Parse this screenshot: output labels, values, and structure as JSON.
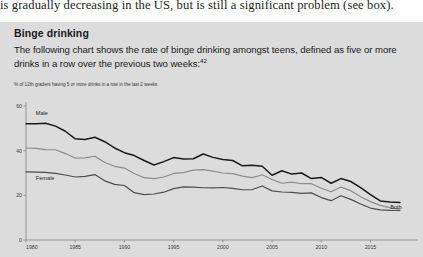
{
  "running_text": "is gradually decreasing in the US, but is still a significant problem (see box).",
  "box": {
    "title": "Binge drinking",
    "body_line1": "The following chart shows the rate of binge drinking amongst teens, defined as five or",
    "body_line2": "more drinks in a row over the previous two weeks:",
    "footnote_marker": "42"
  },
  "chart_data": {
    "type": "line",
    "title": "",
    "subtitle": "",
    "xlabel": "",
    "ylabel": "% of 12th graders having 5 or more drinks in a row in the last 2 weeks",
    "xlim": [
      1980,
      2018
    ],
    "ylim": [
      0,
      60
    ],
    "grid": false,
    "legend_position": "inline-annotations",
    "ytick_labels": [
      "0",
      "20",
      "40",
      "60"
    ],
    "yticks": [
      0,
      20,
      40,
      60
    ],
    "xtick_labels": [
      "1980",
      "1985",
      "1990",
      "1995",
      "2000",
      "2005",
      "2010",
      "2015"
    ],
    "xticks": [
      1980,
      1985,
      1990,
      1995,
      2000,
      2005,
      2010,
      2015
    ],
    "x": [
      1980,
      1981,
      1982,
      1983,
      1984,
      1985,
      1986,
      1987,
      1988,
      1989,
      1990,
      1991,
      1992,
      1993,
      1994,
      1995,
      1996,
      1997,
      1998,
      1999,
      2000,
      2001,
      2002,
      2003,
      2004,
      2005,
      2006,
      2007,
      2008,
      2009,
      2010,
      2011,
      2012,
      2013,
      2014,
      2015,
      2016,
      2017,
      2018
    ],
    "series": [
      {
        "name": "Male",
        "color": "#1a1a1a",
        "width": 1.5,
        "label_x": 1981,
        "label_y": 56,
        "values": [
          52.1,
          52.0,
          52.3,
          51.0,
          48.7,
          45.3,
          45.0,
          46.0,
          44.0,
          41.2,
          39.1,
          37.8,
          35.6,
          33.6,
          35.1,
          36.9,
          36.3,
          36.4,
          38.5,
          37.0,
          36.0,
          35.6,
          33.2,
          33.5,
          33.0,
          29.0,
          31.0,
          29.5,
          30.0,
          27.5,
          28.0,
          25.4,
          27.5,
          26.2,
          23.5,
          20.3,
          17.5,
          17.0,
          16.8
        ]
      },
      {
        "name": "Both",
        "color": "#8c8c8c",
        "width": 1.2,
        "label_x": 2017,
        "label_y": 14,
        "values": [
          41.2,
          41.0,
          40.5,
          40.4,
          38.7,
          36.7,
          36.8,
          37.5,
          34.7,
          33.0,
          32.2,
          29.8,
          27.9,
          27.5,
          28.2,
          29.8,
          30.2,
          31.3,
          31.5,
          30.8,
          30.0,
          29.7,
          28.6,
          27.9,
          29.2,
          27.1,
          25.4,
          25.9,
          25.2,
          25.2,
          23.2,
          21.6,
          23.7,
          22.1,
          19.4,
          17.2,
          15.5,
          14.4,
          13.8
        ]
      },
      {
        "name": "Female",
        "color": "#4d4d4d",
        "width": 1.2,
        "label_x": 1981,
        "label_y": 27,
        "values": [
          30.5,
          30.4,
          30.3,
          29.8,
          29.1,
          28.2,
          28.5,
          29.3,
          26.5,
          24.9,
          24.4,
          21.2,
          20.3,
          20.6,
          21.4,
          23.0,
          23.8,
          23.7,
          23.4,
          23.3,
          23.5,
          23.1,
          22.5,
          22.6,
          24.2,
          22.0,
          21.5,
          21.3,
          20.9,
          21.1,
          19.0,
          17.6,
          19.8,
          18.2,
          16.1,
          14.3,
          13.5,
          13.3,
          13.2
        ]
      }
    ]
  }
}
